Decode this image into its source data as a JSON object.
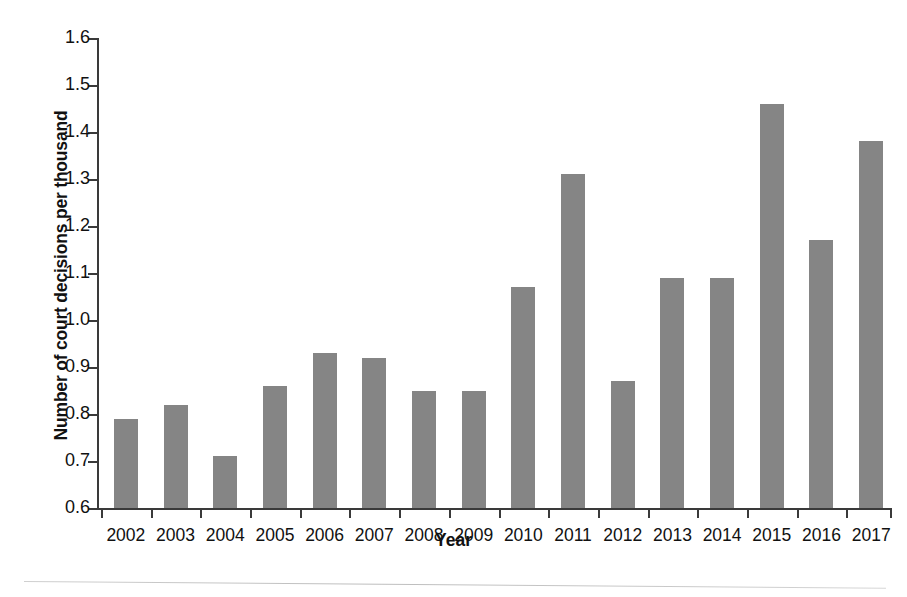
{
  "chart_data": {
    "type": "bar",
    "title": "",
    "xlabel": "Year",
    "ylabel": "Number of court decisions per thousand",
    "categories": [
      "2002",
      "2003",
      "2004",
      "2005",
      "2006",
      "2007",
      "2008",
      "2009",
      "2010",
      "2011",
      "2012",
      "2013",
      "2014",
      "2015",
      "2016",
      "2017"
    ],
    "values": [
      0.79,
      0.82,
      0.71,
      0.86,
      0.93,
      0.92,
      0.85,
      0.85,
      1.07,
      1.31,
      0.87,
      1.09,
      1.09,
      1.46,
      1.17,
      1.38
    ],
    "ylim": [
      0.6,
      1.6
    ],
    "ytick_labels": [
      "1.6",
      "1.5",
      "1.4",
      "1.3",
      "1.2",
      "1.1",
      "1.0",
      "0.9",
      "0.8",
      "0.7",
      "0.6"
    ],
    "ytick_values": [
      1.6,
      1.5,
      1.4,
      1.3,
      1.2,
      1.1,
      1.0,
      0.9,
      0.8,
      0.7,
      0.6
    ],
    "ytick_step": 0.1,
    "grid": false,
    "legend": null,
    "legend_position": "none",
    "bar_color": "#858585",
    "axis_color": "#3a3a3a",
    "background_color": "#ffffff",
    "annotations": []
  }
}
